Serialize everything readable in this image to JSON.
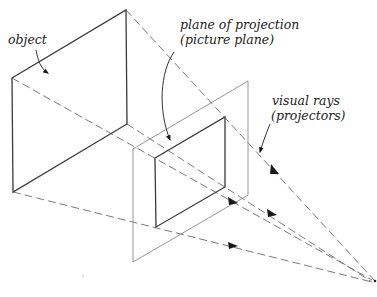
{
  "labels": {
    "object": "object",
    "plane_line1": "plane of projection",
    "plane_line2": "(picture plane)",
    "rays_line1": "visual rays",
    "rays_line2": "(projectors)"
  },
  "elements": {
    "object": "rectangular object (vertical face)",
    "picture_plane": "transparent plane of projection",
    "projected_image": "projected rectangle on picture plane",
    "visual_rays": [
      "ray from top-right corner",
      "ray from top-left corner",
      "ray from bottom-left corner",
      "ray from bottom-right corner"
    ],
    "station_point": "eye / station point"
  },
  "colors": {
    "line": "#3a3a3a",
    "plane_line": "#8a8a8a",
    "ray": "#6a6a6a",
    "text": "#222222"
  }
}
